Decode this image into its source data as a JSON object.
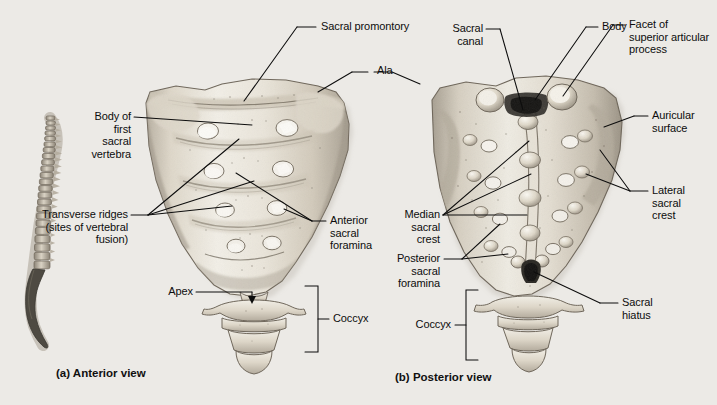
{
  "figure": {
    "background_color": "#eceae6",
    "bone_light": "#f4f1ea",
    "bone_mid": "#cdc6b8",
    "bone_dark": "#8e867a",
    "line_color": "#0d0d0d"
  },
  "panels": [
    {
      "id": "a",
      "caption": "(a) Anterior view"
    },
    {
      "id": "b",
      "caption": "(b) Posterior view"
    }
  ],
  "labels": {
    "sacral_promontory": "Sacral promontory",
    "ala": "Ala",
    "body_of_first_sacral_vertebra": "Body of\nfirst\nsacral\nvertebra",
    "transverse_ridges": "Transverse ridges\n(sites of vertebral\nfusion)",
    "anterior_sacral_foramina": "Anterior\nsacral\nforamina",
    "apex": "Apex",
    "coccyx_a": "Coccyx",
    "sacral_canal": "Sacral\ncanal",
    "body": "Body",
    "facet_of_superior_articular_process": "Facet of\nsuperior articular\nprocess",
    "auricular_surface": "Auricular\nsurface",
    "lateral_sacral_crest": "Lateral\nsacral\ncrest",
    "median_sacral_crest": "Median\nsacral\ncrest",
    "posterior_sacral_foramina": "Posterior\nsacral\nforamina",
    "sacral_hiatus": "Sacral\nhiatus",
    "coccyx_b": "Coccyx"
  },
  "orientation_inset": {
    "name": "vertebral-column-silhouette",
    "highlight_region": "sacrum-and-coccyx"
  }
}
